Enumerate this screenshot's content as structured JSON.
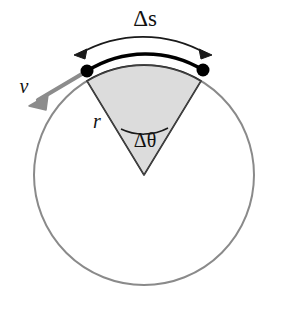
{
  "figure": {
    "background_color": "#ffffff"
  },
  "labels": {
    "arc_length": "Δs",
    "radius": "r",
    "angle": "Δθ",
    "velocity": "v"
  },
  "colors": {
    "circle_stroke": "#8a8a8a",
    "sector_fill": "#dcdcdc",
    "sector_edge": "#1a1a1a",
    "arc_bold": "#000000",
    "velocity_arrow": "#8c8c8c",
    "dot": "#000000",
    "text": "#111111"
  },
  "geometry": {
    "center_x": 144,
    "center_y": 175,
    "radius": 110,
    "left_point_x": 87,
    "left_point_y": 71,
    "right_point_x": 203,
    "right_point_y": 70,
    "half_angle_deg": 28,
    "dot_radius": 6
  },
  "annotations": {
    "arc_measure_label_x": 145,
    "arc_measure_label_y": 26,
    "radius_label_x": 97,
    "radius_label_y": 128,
    "angle_label_x": 145,
    "angle_label_y": 146,
    "velocity_label_x": 24,
    "velocity_label_y": 93
  }
}
